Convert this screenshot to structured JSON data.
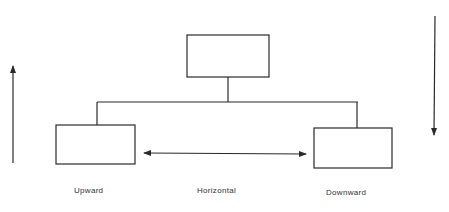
{
  "diagram": {
    "type": "organization-communication-flow",
    "colors": {
      "stroke": "#2a2a2a",
      "text": "#333333",
      "background": "#ffffff"
    },
    "nodes": [
      {
        "id": "top",
        "label": ""
      },
      {
        "id": "left",
        "label": ""
      },
      {
        "id": "right",
        "label": ""
      }
    ],
    "arrows": [
      {
        "id": "upward-arrow",
        "direction": "up"
      },
      {
        "id": "downward-arrow",
        "direction": "down"
      },
      {
        "id": "horizontal-arrow",
        "direction": "both"
      }
    ],
    "labels": {
      "upward": "Upward",
      "horizontal": "Horizontal",
      "downward": "Downward"
    }
  }
}
